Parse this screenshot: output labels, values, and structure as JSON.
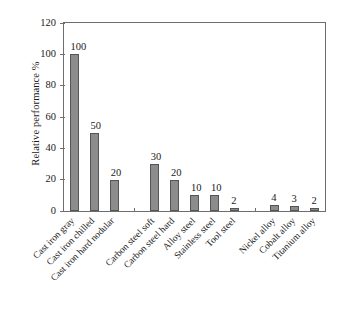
{
  "chart_data": {
    "type": "bar",
    "title": "",
    "xlabel": "",
    "ylabel": "Relative performance %",
    "ylim": [
      0,
      120
    ],
    "yticks": [
      0,
      20,
      40,
      60,
      80,
      100,
      120
    ],
    "grid": false,
    "legend": null,
    "bar_color": "#8c8c8c",
    "bar_edge_color": "#555555",
    "axis_color": "#6e6e6e",
    "categories": [
      "Cast iron gray",
      "Cast iron chilled",
      "Cast iron hard nodular",
      "",
      "Carbon steel soft",
      "Carbon steel hard",
      "Alloy steel",
      "Stainless steel",
      "Tool steel",
      "",
      "Nickel alloy",
      "Cobalt alloy",
      "Titanium alloy"
    ],
    "values": [
      100,
      50,
      20,
      null,
      30,
      20,
      10,
      10,
      2,
      null,
      4,
      3,
      2
    ],
    "value_labels": [
      "100",
      "50",
      "20",
      "",
      "30",
      "20",
      "10",
      "10",
      "2",
      "",
      "4",
      "3",
      "2"
    ]
  }
}
